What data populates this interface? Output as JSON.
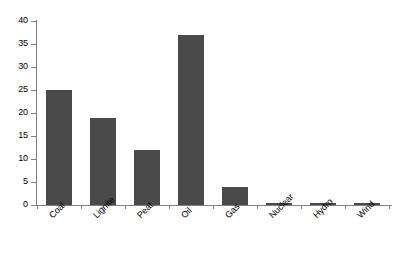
{
  "chart_data": {
    "type": "bar",
    "title": "",
    "subtitle": "",
    "xlabel": "",
    "ylabel": "",
    "categories": [
      "Coal",
      "Lignite",
      "Peat",
      "Oil",
      "Gas",
      "Nuclear",
      "Hydro",
      "Wind"
    ],
    "values": [
      25,
      19,
      12,
      37,
      4,
      0.3,
      0.25,
      0.45
    ],
    "ylim": [
      0,
      40
    ],
    "ytick_values": [
      0,
      5,
      10,
      15,
      20,
      25,
      30,
      35,
      40
    ],
    "ytick_labels": [
      "0",
      "5",
      "10",
      "15",
      "20",
      "25",
      "30",
      "35",
      "40"
    ],
    "grid": false,
    "legend": false,
    "legend_position": "none",
    "bar_color": "#4a4a4a",
    "axis_color": "#808080",
    "background_color": "#ffffff",
    "xtick_label_rotation": -45
  }
}
